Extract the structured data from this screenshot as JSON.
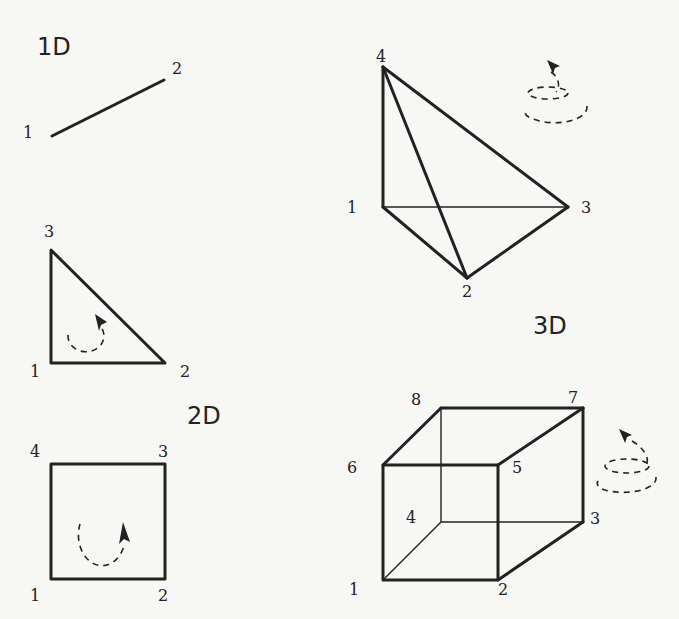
{
  "sections": {
    "oneD": {
      "label": "1D",
      "element": "line",
      "nodes": [
        "1",
        "2"
      ]
    },
    "twoD": {
      "label": "2D",
      "triangle": {
        "nodes": [
          "1",
          "2",
          "3"
        ],
        "orientation": "counter-clockwise"
      },
      "quad": {
        "nodes": [
          "1",
          "2",
          "3",
          "4"
        ],
        "orientation": "counter-clockwise"
      }
    },
    "threeD": {
      "label": "3D",
      "tetrahedron": {
        "nodes": [
          "1",
          "2",
          "3",
          "4"
        ],
        "orientation": "counter-clockwise"
      },
      "hexahedron": {
        "nodes": [
          "1",
          "2",
          "3",
          "4",
          "5",
          "6",
          "7",
          "8"
        ],
        "orientation": "counter-clockwise"
      }
    }
  },
  "colors": {
    "line": "#222222",
    "background": "#f7f7f5"
  }
}
